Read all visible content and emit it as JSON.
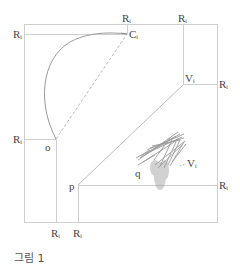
{
  "figure": {
    "caption": "그림 1",
    "colors": {
      "frame": "#c8c8c8",
      "lines": "#bdbdbd",
      "arc": "#9a9a9a",
      "labels": "#444444",
      "sketch": "#888888"
    },
    "labels": {
      "r_top_left_main": "R",
      "r_top_left_sub": "i",
      "r_top_c1_main": "R",
      "r_top_c1_sub": "i",
      "r_top_right_main": "R",
      "r_top_right_sub": "i",
      "c1_main": "C",
      "c1_sub": "i",
      "v1_upper_main": "V",
      "v1_upper_sub": "i",
      "r_right_upper_main": "R",
      "r_right_upper_sub": "i",
      "r_left_mid_main": "R",
      "r_left_mid_sub": "i",
      "o": "o",
      "p": "p",
      "q": "q",
      "v1_lower_main": "V",
      "v1_lower_sub": "i",
      "r_right_lower_main": "R",
      "r_right_lower_sub": "i",
      "r_bottom_o_main": "R",
      "r_bottom_o_sub": "i",
      "r_bottom_p_main": "R",
      "r_bottom_p_sub": "i"
    },
    "points": {
      "C1": [
        127,
        34
      ],
      "o": [
        56,
        139
      ],
      "V1": [
        183,
        84
      ],
      "p": [
        78,
        185
      ]
    }
  }
}
